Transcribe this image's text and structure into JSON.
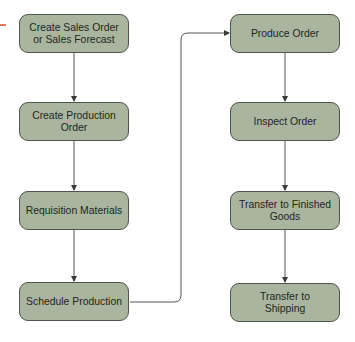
{
  "diagram": {
    "type": "flowchart",
    "colors": {
      "node_fill": "#a9b59f",
      "node_border": "#4e5549",
      "connector": "#555555",
      "entry_mark": "#e07a5f",
      "background": "#ffffff"
    },
    "left_column": [
      {
        "id": "n1",
        "line1": "Create Sales Order",
        "line2": "or Sales Forecast"
      },
      {
        "id": "n2",
        "line1": "Create Production",
        "line2": "Order"
      },
      {
        "id": "n3",
        "line1": "Requisition Materials",
        "line2": ""
      },
      {
        "id": "n4",
        "line1": "Schedule Production",
        "line2": ""
      }
    ],
    "right_column": [
      {
        "id": "n5",
        "line1": "Produce Order",
        "line2": ""
      },
      {
        "id": "n6",
        "line1": "Inspect Order",
        "line2": ""
      },
      {
        "id": "n7",
        "line1": "Transfer to Finished",
        "line2": "Goods"
      },
      {
        "id": "n8",
        "line1": "Transfer to",
        "line2": "Shipping"
      }
    ],
    "edges": [
      {
        "from": "n1",
        "to": "n2"
      },
      {
        "from": "n2",
        "to": "n3"
      },
      {
        "from": "n3",
        "to": "n4"
      },
      {
        "from": "n4",
        "to": "n5"
      },
      {
        "from": "n5",
        "to": "n6"
      },
      {
        "from": "n6",
        "to": "n7"
      },
      {
        "from": "n7",
        "to": "n8"
      }
    ]
  }
}
